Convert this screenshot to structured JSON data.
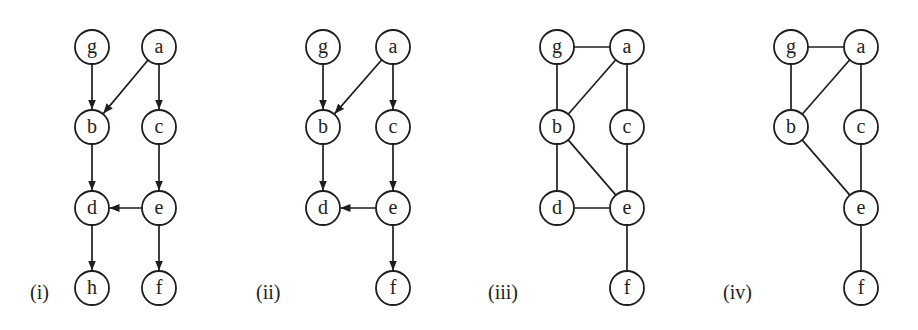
{
  "figure": {
    "node_radius": 17,
    "stroke_color": "#1e1e1e",
    "background": "#ffffff",
    "panels": [
      {
        "id": "i",
        "label": "(i)",
        "label_pos": [
          30,
          292
        ],
        "directed": true,
        "nodes": [
          {
            "id": "g",
            "label": "g",
            "x": 92,
            "y": 47
          },
          {
            "id": "a",
            "label": "a",
            "x": 159,
            "y": 47
          },
          {
            "id": "b",
            "label": "b",
            "x": 92,
            "y": 127
          },
          {
            "id": "c",
            "label": "c",
            "x": 159,
            "y": 127
          },
          {
            "id": "d",
            "label": "d",
            "x": 92,
            "y": 208
          },
          {
            "id": "e",
            "label": "e",
            "x": 159,
            "y": 208
          },
          {
            "id": "h",
            "label": "h",
            "x": 92,
            "y": 288
          },
          {
            "id": "f",
            "label": "f",
            "x": 159,
            "y": 288
          }
        ],
        "edges": [
          {
            "from": "g",
            "to": "b"
          },
          {
            "from": "a",
            "to": "b"
          },
          {
            "from": "a",
            "to": "c"
          },
          {
            "from": "b",
            "to": "d"
          },
          {
            "from": "c",
            "to": "e"
          },
          {
            "from": "e",
            "to": "d"
          },
          {
            "from": "d",
            "to": "h"
          },
          {
            "from": "e",
            "to": "f"
          }
        ]
      },
      {
        "id": "ii",
        "label": "(ii)",
        "label_pos": [
          256,
          292
        ],
        "directed": true,
        "nodes": [
          {
            "id": "g",
            "label": "g",
            "x": 323,
            "y": 47
          },
          {
            "id": "a",
            "label": "a",
            "x": 393,
            "y": 47
          },
          {
            "id": "b",
            "label": "b",
            "x": 323,
            "y": 127
          },
          {
            "id": "c",
            "label": "c",
            "x": 393,
            "y": 127
          },
          {
            "id": "d",
            "label": "d",
            "x": 323,
            "y": 208
          },
          {
            "id": "e",
            "label": "e",
            "x": 393,
            "y": 208
          },
          {
            "id": "f",
            "label": "f",
            "x": 393,
            "y": 288
          }
        ],
        "edges": [
          {
            "from": "g",
            "to": "b"
          },
          {
            "from": "a",
            "to": "b"
          },
          {
            "from": "a",
            "to": "c"
          },
          {
            "from": "b",
            "to": "d"
          },
          {
            "from": "c",
            "to": "e"
          },
          {
            "from": "e",
            "to": "d"
          },
          {
            "from": "e",
            "to": "f"
          }
        ]
      },
      {
        "id": "iii",
        "label": "(iii)",
        "label_pos": [
          488,
          292
        ],
        "directed": false,
        "nodes": [
          {
            "id": "g",
            "label": "g",
            "x": 557,
            "y": 47
          },
          {
            "id": "a",
            "label": "a",
            "x": 627,
            "y": 47
          },
          {
            "id": "b",
            "label": "b",
            "x": 557,
            "y": 127
          },
          {
            "id": "c",
            "label": "c",
            "x": 627,
            "y": 127
          },
          {
            "id": "d",
            "label": "d",
            "x": 557,
            "y": 208
          },
          {
            "id": "e",
            "label": "e",
            "x": 627,
            "y": 208
          },
          {
            "id": "f",
            "label": "f",
            "x": 627,
            "y": 288
          }
        ],
        "edges": [
          {
            "from": "g",
            "to": "a"
          },
          {
            "from": "g",
            "to": "b"
          },
          {
            "from": "a",
            "to": "b"
          },
          {
            "from": "a",
            "to": "c"
          },
          {
            "from": "b",
            "to": "d"
          },
          {
            "from": "b",
            "to": "e"
          },
          {
            "from": "c",
            "to": "e"
          },
          {
            "from": "d",
            "to": "e"
          },
          {
            "from": "e",
            "to": "f"
          }
        ]
      },
      {
        "id": "iv",
        "label": "(iv)",
        "label_pos": [
          723,
          292
        ],
        "directed": false,
        "nodes": [
          {
            "id": "g",
            "label": "g",
            "x": 791,
            "y": 47
          },
          {
            "id": "a",
            "label": "a",
            "x": 861,
            "y": 47
          },
          {
            "id": "b",
            "label": "b",
            "x": 791,
            "y": 127
          },
          {
            "id": "c",
            "label": "c",
            "x": 861,
            "y": 127
          },
          {
            "id": "e",
            "label": "e",
            "x": 861,
            "y": 208
          },
          {
            "id": "f",
            "label": "f",
            "x": 861,
            "y": 288
          }
        ],
        "edges": [
          {
            "from": "g",
            "to": "a"
          },
          {
            "from": "g",
            "to": "b"
          },
          {
            "from": "a",
            "to": "b"
          },
          {
            "from": "a",
            "to": "c"
          },
          {
            "from": "b",
            "to": "e"
          },
          {
            "from": "c",
            "to": "e"
          },
          {
            "from": "e",
            "to": "f"
          }
        ]
      }
    ]
  }
}
